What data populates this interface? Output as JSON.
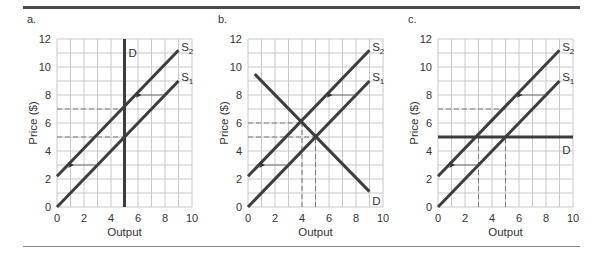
{
  "colors": {
    "curve": "#3d3d3d",
    "grid": "#c8c8c8",
    "dash": "#7a7a7a",
    "arrow": "#555555",
    "rule_top": "#4a4a4a",
    "rule_bottom": "#8a8a8a"
  },
  "chart_data": [
    {
      "type": "line",
      "panel_label": "a.",
      "title": "",
      "xlabel": "Output",
      "ylabel": "Price ($)",
      "xlim": [
        0,
        10
      ],
      "ylim": [
        0,
        12
      ],
      "xticks": [
        0,
        2,
        4,
        6,
        8,
        10
      ],
      "yticks": [
        0,
        2,
        4,
        6,
        8,
        10,
        12
      ],
      "grid": true,
      "series": [
        {
          "name": "S1",
          "label_main": "S",
          "label_sub": "1",
          "points": [
            [
              0,
              0
            ],
            [
              9,
              9
            ]
          ]
        },
        {
          "name": "S2",
          "label_main": "S",
          "label_sub": "2",
          "points": [
            [
              0,
              2.2
            ],
            [
              9,
              11.2
            ]
          ]
        },
        {
          "name": "D",
          "label_main": "D",
          "label_sub": "",
          "points": [
            [
              5,
              0
            ],
            [
              5,
              12
            ]
          ]
        }
      ],
      "label_positions": {
        "S1": [
          9.2,
          9.3
        ],
        "S2": [
          9.2,
          11.4
        ],
        "D": [
          5.3,
          11.0
        ]
      },
      "dashed_guides": [
        {
          "from": [
            0,
            7
          ],
          "to": [
            5,
            7
          ]
        },
        {
          "from": [
            0,
            5
          ],
          "to": [
            5,
            5
          ]
        }
      ],
      "shift_arrows": [
        {
          "from": [
            8,
            8
          ],
          "to": [
            5.9,
            8
          ]
        },
        {
          "from": [
            3,
            3
          ],
          "to": [
            0.9,
            3
          ]
        }
      ],
      "equilibria": [
        {
          "curve": "S1",
          "x": 5,
          "y": 5
        },
        {
          "curve": "S2",
          "x": 5,
          "y": 7.2
        }
      ]
    },
    {
      "type": "line",
      "panel_label": "b.",
      "title": "",
      "xlabel": "Output",
      "ylabel": "Price ($)",
      "xlim": [
        0,
        10
      ],
      "ylim": [
        0,
        12
      ],
      "xticks": [
        0,
        2,
        4,
        6,
        8,
        10
      ],
      "yticks": [
        0,
        2,
        4,
        6,
        8,
        10,
        12
      ],
      "grid": true,
      "series": [
        {
          "name": "S1",
          "label_main": "S",
          "label_sub": "1",
          "points": [
            [
              0,
              0
            ],
            [
              9,
              9
            ]
          ]
        },
        {
          "name": "S2",
          "label_main": "S",
          "label_sub": "2",
          "points": [
            [
              0,
              2.2
            ],
            [
              9,
              11.2
            ]
          ]
        },
        {
          "name": "D",
          "label_main": "D",
          "label_sub": "",
          "points": [
            [
              0.5,
              9.5
            ],
            [
              9,
              1.1
            ]
          ]
        }
      ],
      "label_positions": {
        "S1": [
          9.2,
          9.3
        ],
        "S2": [
          9.2,
          11.4
        ],
        "D": [
          9.2,
          0.4
        ]
      },
      "dashed_guides": [
        {
          "from": [
            0,
            6
          ],
          "to": [
            4,
            6
          ]
        },
        {
          "from": [
            0,
            5
          ],
          "to": [
            5,
            5
          ]
        },
        {
          "from": [
            4,
            0
          ],
          "to": [
            4,
            6
          ]
        },
        {
          "from": [
            5,
            0
          ],
          "to": [
            5,
            5
          ]
        }
      ],
      "shift_arrows": [
        {
          "from": [
            8,
            8
          ],
          "to": [
            5.9,
            8
          ]
        },
        {
          "from": [
            3,
            3
          ],
          "to": [
            0.9,
            3
          ]
        }
      ],
      "equilibria": [
        {
          "curve": "S1",
          "x": 5,
          "y": 5
        },
        {
          "curve": "S2",
          "x": 4,
          "y": 6
        }
      ]
    },
    {
      "type": "line",
      "panel_label": "c.",
      "title": "",
      "xlabel": "Output",
      "ylabel": "Price ($)",
      "xlim": [
        0,
        10
      ],
      "ylim": [
        0,
        12
      ],
      "xticks": [
        0,
        2,
        4,
        6,
        8,
        10
      ],
      "yticks": [
        0,
        2,
        4,
        6,
        8,
        10,
        12
      ],
      "grid": true,
      "series": [
        {
          "name": "S1",
          "label_main": "S",
          "label_sub": "1",
          "points": [
            [
              0,
              0
            ],
            [
              9,
              9
            ]
          ]
        },
        {
          "name": "S2",
          "label_main": "S",
          "label_sub": "2",
          "points": [
            [
              0,
              2.2
            ],
            [
              9,
              11.2
            ]
          ]
        },
        {
          "name": "D",
          "label_main": "D",
          "label_sub": "",
          "points": [
            [
              0,
              5
            ],
            [
              10,
              5
            ]
          ]
        }
      ],
      "label_positions": {
        "S1": [
          9.2,
          9.3
        ],
        "S2": [
          9.2,
          11.4
        ],
        "D": [
          9.2,
          4.1
        ]
      },
      "dashed_guides": [
        {
          "from": [
            0,
            7
          ],
          "to": [
            5,
            7
          ]
        },
        {
          "from": [
            3,
            0
          ],
          "to": [
            3,
            5
          ]
        },
        {
          "from": [
            5,
            0
          ],
          "to": [
            5,
            5
          ]
        }
      ],
      "shift_arrows": [
        {
          "from": [
            8,
            8
          ],
          "to": [
            5.9,
            8
          ]
        },
        {
          "from": [
            3,
            3
          ],
          "to": [
            0.9,
            3
          ]
        }
      ],
      "equilibria": [
        {
          "curve": "S1",
          "x": 5,
          "y": 5
        },
        {
          "curve": "S2",
          "x": 3,
          "y": 5
        }
      ]
    }
  ],
  "layout": {
    "panels": [
      {
        "grid_left": 57,
        "grid_right": 192,
        "grid_top": 39,
        "grid_bottom": 207,
        "label_x": 27,
        "label_y": 23
      },
      {
        "grid_left": 248,
        "grid_right": 383,
        "grid_top": 39,
        "grid_bottom": 207,
        "label_x": 218,
        "label_y": 23
      },
      {
        "grid_left": 438,
        "grid_right": 573,
        "grid_top": 39,
        "grid_bottom": 207,
        "label_x": 408,
        "label_y": 23
      }
    ]
  }
}
